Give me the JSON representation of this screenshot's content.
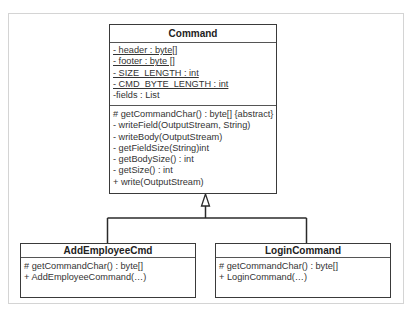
{
  "diagram": {
    "type": "uml-class-diagram",
    "relationship": "generalization",
    "classes": {
      "command": {
        "name": "Command",
        "attributes": [
          {
            "text": "- header : byte[]",
            "static": true
          },
          {
            "text": "- footer : byte []",
            "static": true
          },
          {
            "text": "- SIZE_LENGTH : int",
            "static": true
          },
          {
            "text": "- CMD_BYTE_LENGTH : int",
            "static": true
          },
          {
            "text": "-fields : List",
            "static": false
          }
        ],
        "operations": [
          "# getCommandChar() : byte[] {abstract}",
          "- writeField(OutputStream, String)",
          "- writeBody(OutputStream)",
          "- getFieldSize(String)int",
          "- getBodySize() : int",
          "- getSize() : int",
          "+ write(OutputStream)"
        ]
      },
      "add_employee_cmd": {
        "name": "AddEmployeeCmd",
        "operations": [
          "# getCommandChar() : byte[]",
          "+ AddEmployeeCommand(…)"
        ]
      },
      "login_command": {
        "name": "LoginCommand",
        "operations": [
          "# getCommandChar() : byte[]",
          "+ LoginCommand(…)"
        ]
      }
    }
  }
}
